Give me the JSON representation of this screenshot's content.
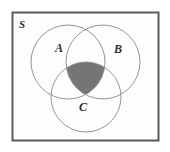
{
  "figure": {
    "name": "venn-diagram-three-sets",
    "type": "venn",
    "universe": {
      "label": "S",
      "border_color": "#5a5a5a",
      "fill_color": "#fdfdfd"
    },
    "sets": [
      {
        "id": "A",
        "label": "A",
        "cx": 68,
        "cy": 62,
        "r": 37,
        "label_x": 59,
        "label_y": 52
      },
      {
        "id": "B",
        "label": "B",
        "cx": 103,
        "cy": 62,
        "r": 37,
        "label_x": 118,
        "label_y": 53
      },
      {
        "id": "C",
        "label": "C",
        "cx": 86,
        "cy": 97,
        "r": 35,
        "label_x": 83,
        "label_y": 111
      }
    ],
    "shaded_region": {
      "name": "A-intersect-B-intersect-C",
      "expression": "A ∩ B ∩ C",
      "fill_color": "#757575",
      "stroke_color": "#4a4a4a"
    },
    "stroke": {
      "circle_color": "#8a8a8a",
      "circle_width": 0.9,
      "rect_width": 2
    },
    "rect": {
      "x": 12,
      "y": 12,
      "width": 147,
      "height": 129
    }
  }
}
